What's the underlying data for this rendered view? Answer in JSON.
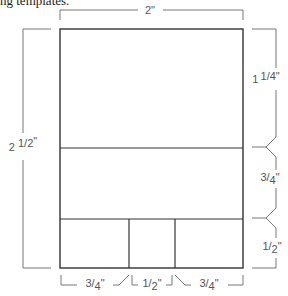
{
  "caption": "ng templates.",
  "diagram": {
    "width_label": "2\"",
    "height_label": {
      "whole": "2",
      "frac_num": "1",
      "frac_den": "2",
      "unit": "\""
    },
    "right_segments": [
      {
        "whole": "1",
        "frac_num": "1",
        "frac_den": "4",
        "unit": "\""
      },
      {
        "whole": "",
        "frac_num": "3",
        "frac_den": "4",
        "unit": "\""
      },
      {
        "whole": "",
        "frac_num": "1",
        "frac_den": "2",
        "unit": "\""
      }
    ],
    "bottom_segments": [
      {
        "frac_num": "3",
        "frac_den": "4",
        "unit": "\""
      },
      {
        "frac_num": "1",
        "frac_den": "2",
        "unit": "\""
      },
      {
        "frac_num": "3",
        "frac_den": "4",
        "unit": "\""
      }
    ],
    "colors": {
      "outline": "#333333",
      "dimension": "#777777",
      "text": "#555555"
    }
  }
}
